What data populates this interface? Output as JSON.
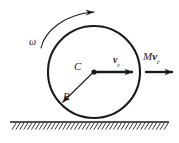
{
  "figure": {
    "canvas": {
      "width": 179,
      "height": 143
    },
    "colors": {
      "ink": "#1a1a1a",
      "background": "#ffffff",
      "ground": "#1a1a1a"
    }
  },
  "labels": {
    "omega": "ω",
    "center": "C",
    "radius": "R",
    "velocity_symbol": "v",
    "velocity_subscript": "c",
    "momentum_mass": "M",
    "momentum_symbol": "v",
    "momentum_subscript": "c"
  },
  "geometry": {
    "circle": {
      "cx": 94,
      "cy": 72,
      "r": 46
    },
    "center_dot": {
      "cx": 94,
      "cy": 72,
      "r": 2.6
    },
    "ground_line": {
      "x1": 10,
      "y1": 122,
      "x2": 169,
      "y2": 122
    },
    "hatch": {
      "count": 40,
      "x_start": 12,
      "x_end": 168,
      "depth": 7
    },
    "radius_arrow": {
      "x1": 94,
      "y1": 72,
      "x2": 61,
      "y2": 104
    },
    "velocity_arrow": {
      "x1": 94,
      "y1": 72,
      "x2": 133,
      "y2": 72
    },
    "momentum_arrow": {
      "x1": 145,
      "y1": 72,
      "x2": 173,
      "y2": 72
    },
    "omega_arc": {
      "start_x": 41,
      "start_y": 47,
      "end_x": 95,
      "end_y": 12
    }
  },
  "icon_names": {
    "circle": "disc-outline-icon",
    "arrow": "arrow-head-icon",
    "hatch": "ground-hatching-icon",
    "dot": "center-point-icon",
    "arc": "rotation-arc-arrow-icon"
  }
}
